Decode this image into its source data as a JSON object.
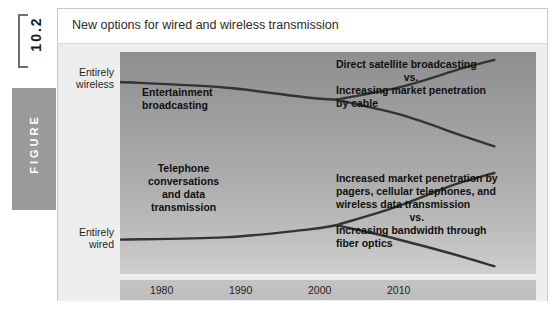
{
  "figure": {
    "number": "10.2",
    "tab_label": "FIGURE",
    "caption": "New options for wired and wireless transmission"
  },
  "chart_data": {
    "type": "line",
    "title": "New options for wired and wireless transmission",
    "xlabel": "",
    "ylabel": "",
    "x_ticks": [
      "1980",
      "1990",
      "2000",
      "2010"
    ],
    "x_tick_positions": [
      0.1,
      0.29,
      0.48,
      0.67
    ],
    "y_axis_labels": [
      {
        "text": "Entirely\nwireless",
        "position": "top"
      },
      {
        "text": "Entirely\nwired",
        "position": "bottom"
      }
    ],
    "ylim_labels": [
      "Entirely wired",
      "Entirely wireless"
    ],
    "grid": false,
    "legend": "none",
    "series": [
      {
        "name": "Entertainment broadcasting",
        "annotation_left": "Entertainment\nbroadcasting",
        "points": [
          [
            0.0,
            0.135
          ],
          [
            0.25,
            0.16
          ],
          [
            0.45,
            0.205
          ],
          [
            0.52,
            0.215
          ]
        ]
      },
      {
        "name": "Direct satellite broadcasting",
        "annotation_right": "Direct satellite broadcasting",
        "points": [
          [
            0.52,
            0.215
          ],
          [
            0.68,
            0.155
          ],
          [
            0.82,
            0.075
          ],
          [
            0.9,
            0.035
          ]
        ]
      },
      {
        "name": "Increasing market penetration by cable",
        "annotation_right": "Increasing market penetration by cable",
        "points": [
          [
            0.52,
            0.215
          ],
          [
            0.68,
            0.285
          ],
          [
            0.82,
            0.375
          ],
          [
            0.9,
            0.425
          ]
        ]
      },
      {
        "name": "Telephone conversations and data transmission",
        "annotation_left": "Telephone\nconversations\nand data\ntransmission",
        "points": [
          [
            0.0,
            0.845
          ],
          [
            0.25,
            0.835
          ],
          [
            0.45,
            0.8
          ],
          [
            0.52,
            0.78
          ]
        ]
      },
      {
        "name": "Increased market penetration by pagers, cellular telephones, and wireless data transmission",
        "annotation_right": "Increased market penetration by pagers, cellular telephones, and wireless data transmission",
        "points": [
          [
            0.52,
            0.78
          ],
          [
            0.66,
            0.7
          ],
          [
            0.8,
            0.6
          ],
          [
            0.9,
            0.545
          ]
        ]
      },
      {
        "name": "Increasing bandwidth through fiber optics",
        "annotation_right": "Increasing bandwidth through fiber optics",
        "points": [
          [
            0.52,
            0.78
          ],
          [
            0.66,
            0.84
          ],
          [
            0.8,
            0.91
          ],
          [
            0.9,
            0.965
          ]
        ]
      }
    ],
    "annotations": {
      "entertainment_line1": "Entertainment",
      "entertainment_line2": "broadcasting",
      "satellite_line1": "Direct satellite broadcasting",
      "satellite_vs": "vs.",
      "satellite_line2": "Increasing market penetration",
      "satellite_line3": "by cable",
      "telephone_line1": "Telephone",
      "telephone_line2": "conversations",
      "telephone_line3": "and data",
      "telephone_line4": "transmission",
      "pagers_line1": "Increased market penetration by",
      "pagers_line2": "pagers, cellular telephones, and",
      "pagers_line3": "wireless data transmission",
      "pagers_vs": "vs.",
      "fiber_line1": "Increasing bandwidth through",
      "fiber_line2": "fiber optics"
    },
    "axis_labels": {
      "wireless_line1": "Entirely",
      "wireless_line2": "wireless",
      "wired_line1": "Entirely",
      "wired_line2": "wired"
    },
    "colors": {
      "line": "#333333",
      "plot_top": "#8e8e8e",
      "plot_bottom": "#cfcfcf",
      "body": "#eeeeee",
      "tab": "#9a9a9a"
    }
  }
}
